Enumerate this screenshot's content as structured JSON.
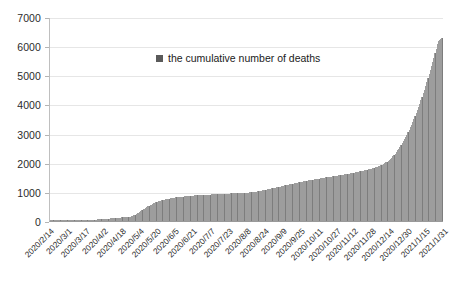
{
  "chart_data": {
    "type": "bar",
    "title": "",
    "subtitle": "",
    "xlabel": "",
    "ylabel": "",
    "ylim": [
      0,
      7000
    ],
    "ytick_step": 1000,
    "yticks": [
      0,
      1000,
      2000,
      3000,
      4000,
      5000,
      6000,
      7000
    ],
    "ytick_labels": [
      "0",
      "1000",
      "2000",
      "3000",
      "4000",
      "5000",
      "6000",
      "7000"
    ],
    "grid": true,
    "legend_position": "inside-top-center",
    "legend": [
      {
        "name": "the cumulative number of deaths",
        "color": "#7d7d7d"
      }
    ],
    "series": [
      {
        "name": "the cumulative number of deaths",
        "color": "#7d7d7d",
        "values": [
          1,
          1,
          1,
          1,
          1,
          1,
          1,
          1,
          2,
          2,
          2,
          3,
          4,
          5,
          5,
          6,
          6,
          7,
          7,
          8,
          9,
          10,
          11,
          12,
          13,
          15,
          17,
          19,
          22,
          24,
          27,
          29,
          32,
          35,
          38,
          41,
          43,
          46,
          49,
          52,
          55,
          57,
          59,
          62,
          65,
          67,
          70,
          73,
          77,
          81,
          85,
          89,
          93,
          97,
          100,
          104,
          107,
          110,
          113,
          116,
          119,
          122,
          125,
          128,
          132,
          136,
          141,
          147,
          155,
          165,
          178,
          195,
          215,
          238,
          263,
          290,
          318,
          345,
          372,
          400,
          428,
          455,
          480,
          503,
          525,
          545,
          566,
          585,
          604,
          622,
          640,
          657,
          673,
          688,
          702,
          715,
          727,
          738,
          748,
          757,
          766,
          774,
          781,
          788,
          794,
          800,
          806,
          812,
          818,
          823,
          828,
          833,
          838,
          843,
          848,
          853,
          857,
          861,
          865,
          869,
          872,
          875,
          878,
          881,
          884,
          887,
          890,
          893,
          896,
          899,
          901,
          903,
          905,
          907,
          909,
          911,
          913,
          915,
          917,
          919,
          921,
          923,
          925,
          927,
          929,
          931,
          933,
          935,
          937,
          939,
          941,
          943,
          945,
          947,
          949,
          951,
          953,
          955,
          957,
          959,
          961,
          963,
          965,
          967,
          969,
          971,
          974,
          977,
          980,
          983,
          986,
          990,
          994,
          999,
          1004,
          1010,
          1016,
          1023,
          1030,
          1038,
          1046,
          1055,
          1064,
          1073,
          1082,
          1091,
          1100,
          1109,
          1118,
          1127,
          1136,
          1145,
          1154,
          1163,
          1172,
          1181,
          1190,
          1199,
          1208,
          1217,
          1226,
          1235,
          1244,
          1253,
          1262,
          1271,
          1280,
          1289,
          1298,
          1307,
          1316,
          1325,
          1334,
          1342,
          1350,
          1358,
          1366,
          1374,
          1382,
          1390,
          1398,
          1406,
          1414,
          1422,
          1430,
          1437,
          1444,
          1451,
          1458,
          1465,
          1472,
          1479,
          1486,
          1492,
          1498,
          1504,
          1510,
          1516,
          1522,
          1528,
          1534,
          1540,
          1546,
          1552,
          1558,
          1564,
          1570,
          1576,
          1583,
          1590,
          1597,
          1604,
          1611,
          1618,
          1625,
          1633,
          1641,
          1649,
          1657,
          1665,
          1673,
          1682,
          1691,
          1700,
          1709,
          1718,
          1727,
          1737,
          1747,
          1757,
          1767,
          1777,
          1788,
          1799,
          1810,
          1822,
          1834,
          1847,
          1861,
          1876,
          1892,
          1909,
          1927,
          1947,
          1969,
          1993,
          2019,
          2047,
          2078,
          2112,
          2149,
          2189,
          2232,
          2278,
          2327,
          2379,
          2434,
          2492,
          2553,
          2617,
          2684,
          2754,
          2827,
          2903,
          2982,
          3064,
          3149,
          3237,
          3328,
          3422,
          3519,
          3619,
          3722,
          3828,
          3937,
          4049,
          4164,
          4282,
          4403,
          4527,
          4654,
          4784,
          4917,
          5053,
          5192,
          5334,
          5479,
          5627,
          5778,
          5932,
          6089,
          6200,
          6250,
          6280,
          6300
        ]
      }
    ],
    "x_start": "2020/2/14",
    "x_end": "2021/1/31",
    "xtick_labels": [
      "2020/2/14",
      "2020/3/1",
      "2020/3/17",
      "2020/4/2",
      "2020/4/18",
      "2020/5/4",
      "2020/5/20",
      "2020/6/5",
      "2020/6/21",
      "2020/7/7",
      "2020/7/23",
      "2020/8/8",
      "2020/8/24",
      "2020/9/9",
      "2020/9/25",
      "2020/10/11",
      "2020/10/27",
      "2020/11/12",
      "2020/11/28",
      "2020/12/14",
      "2020/12/30",
      "2021/1/15",
      "2021/1/31"
    ],
    "colors": {
      "bar": "#7d7d7d",
      "gridline": "#e6e6e6",
      "axis": "#9a9a9a",
      "text": "#1a1a1a",
      "background": "#ffffff"
    }
  }
}
